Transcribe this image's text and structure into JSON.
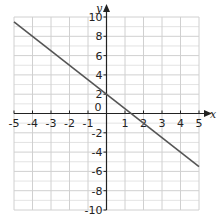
{
  "chart_data": {
    "type": "line",
    "title": "",
    "xlabel": "x",
    "ylabel": "y",
    "xlim": [
      -5,
      5
    ],
    "ylim": [
      -10,
      10
    ],
    "grid": true,
    "x_ticks": [
      -5,
      -4,
      -3,
      -2,
      -1,
      0,
      1,
      2,
      3,
      4,
      5
    ],
    "x_tick_labels": [
      "-5",
      "-4",
      "-3",
      "-2",
      "-1",
      "",
      "1",
      "2",
      "3",
      "4",
      "5"
    ],
    "y_ticks": [
      -10,
      -8,
      -6,
      -4,
      -2,
      0,
      2,
      4,
      6,
      8,
      10
    ],
    "y_tick_labels": [
      "-10",
      "-8",
      "-6",
      "-4",
      "-2",
      "0",
      "2",
      "4",
      "6",
      "8",
      "10"
    ],
    "series": [
      {
        "name": "line",
        "equation": "y = -1.5x + 2",
        "x": [
          -5,
          5
        ],
        "y": [
          9.5,
          -5.5
        ],
        "color": "#555555"
      }
    ]
  },
  "labels": {
    "x_axis": "x",
    "y_axis": "y",
    "origin": "0"
  },
  "colors": {
    "grid": "#d0d0d0",
    "axis": "#222222",
    "line": "#555555"
  }
}
